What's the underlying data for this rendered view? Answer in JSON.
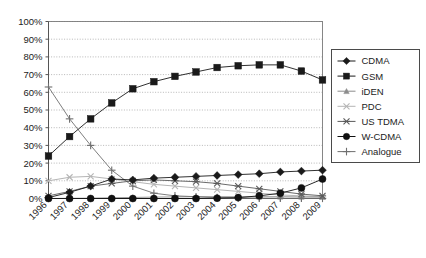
{
  "chart_data": {
    "type": "line",
    "title": "",
    "xlabel": "",
    "ylabel": "",
    "x": [
      "1996",
      "1997",
      "1998",
      "1999",
      "2000",
      "2001",
      "2002",
      "2003",
      "2004",
      "2005",
      "2006",
      "2007",
      "2008",
      "2009"
    ],
    "categories": [
      "1996",
      "1997",
      "1998",
      "1999",
      "2000",
      "2001",
      "2002",
      "2003",
      "2004",
      "2005",
      "2006",
      "2007",
      "2008",
      "2009"
    ],
    "ylim": [
      0,
      100
    ],
    "xlim_labels": [
      "1996",
      "2009"
    ],
    "ytick_labels": [
      "0%",
      "10%",
      "20%",
      "30%",
      "40%",
      "50%",
      "60%",
      "70%",
      "80%",
      "90%",
      "100%"
    ],
    "ytick_values": [
      0,
      10,
      20,
      30,
      40,
      50,
      60,
      70,
      80,
      90,
      100
    ],
    "grid": "horizontal-dotted",
    "legend_position": "right",
    "series": [
      {
        "name": "CDMA",
        "marker": "diamond",
        "color": "#1a1a1a",
        "values": [
          0.5,
          3.5,
          7,
          11,
          10.5,
          11.5,
          12,
          12.5,
          13,
          13.5,
          14,
          15,
          15.5,
          16
        ]
      },
      {
        "name": "GSM",
        "marker": "square",
        "color": "#1a1a1a",
        "values": [
          24,
          35,
          45,
          54,
          62,
          66,
          69,
          71.5,
          74,
          75,
          75.5,
          75.5,
          72,
          67
        ]
      },
      {
        "name": "iDEN",
        "marker": "triangle",
        "color": "#8c8c8c",
        "values": [
          0,
          0.1,
          0.2,
          0.4,
          0.6,
          0.8,
          0.9,
          1,
          1,
          1,
          1,
          1,
          0.9,
          0.8
        ]
      },
      {
        "name": "PDC",
        "marker": "x-light",
        "color": "#b5b5b5",
        "values": [
          10,
          12,
          12.5,
          11,
          9.5,
          8,
          7,
          6,
          5,
          4,
          3,
          2,
          1.5,
          1
        ]
      },
      {
        "name": "US TDMA",
        "marker": "asterisk",
        "color": "#5a5a5a",
        "values": [
          1.5,
          4,
          7,
          8.5,
          10,
          10.5,
          10,
          9.5,
          8.5,
          7,
          5.5,
          4,
          2.5,
          1.5
        ]
      },
      {
        "name": "W-CDMA",
        "marker": "circle",
        "color": "#111111",
        "values": [
          0,
          0,
          0,
          0,
          0,
          0,
          0,
          0,
          0.2,
          0.5,
          1.5,
          3,
          6,
          11
        ]
      },
      {
        "name": "Analogue",
        "marker": "plus",
        "color": "#6f6f6f",
        "values": [
          63,
          45,
          30,
          16,
          7,
          3,
          1.5,
          1,
          0.5,
          0.3,
          0.2,
          0.1,
          0.1,
          0.1
        ]
      }
    ],
    "legend_entries": [
      "CDMA",
      "GSM",
      "iDEN",
      "PDC",
      "US TDMA",
      "W-CDMA",
      "Analogue"
    ]
  },
  "legend": {
    "items": [
      {
        "label": "CDMA"
      },
      {
        "label": "GSM"
      },
      {
        "label": "iDEN"
      },
      {
        "label": "PDC"
      },
      {
        "label": "US TDMA"
      },
      {
        "label": "W-CDMA"
      },
      {
        "label": "Analogue"
      }
    ]
  }
}
